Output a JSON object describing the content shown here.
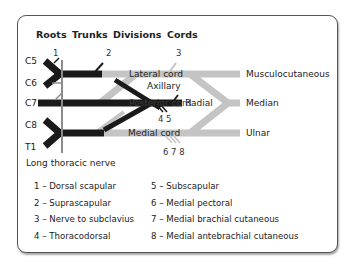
{
  "headers": {
    "roots": "Roots",
    "trunks": "Trunks",
    "divisions": "Divisions",
    "cords": "Cords"
  },
  "roots": {
    "c5": "C5",
    "c6": "C6",
    "c7": "C7",
    "c8": "C8",
    "t1": "T1"
  },
  "markers": {
    "n1": "1",
    "n2": "2",
    "n3": "3",
    "n45": "4 5",
    "n678": "6 7 8"
  },
  "cords": {
    "lateral": "Lateral cord",
    "posterior": "Posterior cord",
    "medial": "Medial cord"
  },
  "branches": {
    "axillary": "Axillary",
    "radial": "Radial",
    "musculocutaneous": "Musculocutaneous",
    "median": "Median",
    "ulnar": "Ulnar",
    "long_thoracic": "Long thoracic nerve"
  },
  "legend": {
    "left": [
      "1 – Dorsal scapular",
      "2 – Suprascapular",
      "3 – Nerve to subclavius",
      "4 – Thoracodorsal"
    ],
    "right": [
      "5 – Subscapular",
      "6 – Medial pectoral",
      "7 – Medial brachial cutaneous",
      "8 – Medial antebrachial cutaneous"
    ]
  },
  "colors": {
    "dark": "#1a1a1a",
    "light": "#c4c4c4",
    "thoracic": "#8c8c8c"
  }
}
